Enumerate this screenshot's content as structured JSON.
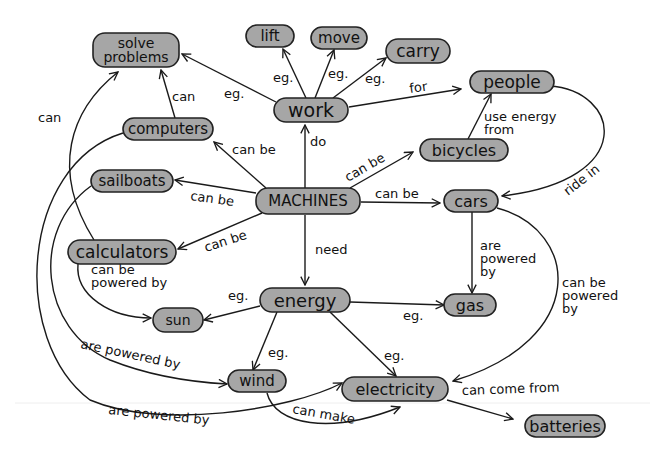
{
  "diagram": {
    "type": "concept-map",
    "colors": {
      "node_fill": "#a6a6a6",
      "node_stroke": "#222222",
      "line": "#1a1a1a",
      "background": "#ffffff"
    },
    "nodes": [
      {
        "id": "machines",
        "label": "MACHINES",
        "x": 308,
        "y": 201,
        "w": 104,
        "h": 26,
        "fs": 15
      },
      {
        "id": "work",
        "label": "work",
        "x": 311,
        "y": 110,
        "w": 74,
        "h": 24,
        "fs": 19
      },
      {
        "id": "lift",
        "label": "lift",
        "x": 270,
        "y": 36,
        "w": 48,
        "h": 22,
        "fs": 15
      },
      {
        "id": "move",
        "label": "move",
        "x": 339,
        "y": 38,
        "w": 56,
        "h": 22,
        "fs": 15
      },
      {
        "id": "carry",
        "label": "carry",
        "x": 418,
        "y": 51,
        "w": 64,
        "h": 24,
        "fs": 17
      },
      {
        "id": "solve_problems",
        "label": "solve|problems",
        "x": 136,
        "y": 50,
        "w": 86,
        "h": 34,
        "fs": 14
      },
      {
        "id": "people",
        "label": "people",
        "x": 512,
        "y": 82,
        "w": 84,
        "h": 22,
        "fs": 17
      },
      {
        "id": "computers",
        "label": "computers",
        "x": 168,
        "y": 129,
        "w": 90,
        "h": 22,
        "fs": 15
      },
      {
        "id": "bicycles",
        "label": "bicycles",
        "x": 464,
        "y": 150,
        "w": 88,
        "h": 22,
        "fs": 16
      },
      {
        "id": "sailboats",
        "label": "sailboats",
        "x": 132,
        "y": 181,
        "w": 82,
        "h": 22,
        "fs": 15
      },
      {
        "id": "cars",
        "label": "cars",
        "x": 471,
        "y": 201,
        "w": 54,
        "h": 22,
        "fs": 16
      },
      {
        "id": "calculators",
        "label": "calculators",
        "x": 122,
        "y": 252,
        "w": 108,
        "h": 24,
        "fs": 17
      },
      {
        "id": "energy",
        "label": "energy",
        "x": 305,
        "y": 300,
        "w": 90,
        "h": 24,
        "fs": 18
      },
      {
        "id": "sun",
        "label": "sun",
        "x": 178,
        "y": 320,
        "w": 50,
        "h": 24,
        "fs": 14
      },
      {
        "id": "gas",
        "label": "gas",
        "x": 470,
        "y": 305,
        "w": 52,
        "h": 22,
        "fs": 16
      },
      {
        "id": "wind",
        "label": "wind",
        "x": 257,
        "y": 381,
        "w": 58,
        "h": 22,
        "fs": 15
      },
      {
        "id": "electricity",
        "label": "electricity",
        "x": 395,
        "y": 389,
        "w": 106,
        "h": 24,
        "fs": 16
      },
      {
        "id": "batteries",
        "label": "batteries",
        "x": 565,
        "y": 426,
        "w": 80,
        "h": 22,
        "fs": 16
      }
    ],
    "edges": [
      {
        "from": "work",
        "to": "lift",
        "label": "eg.",
        "d": "M 306 98 L 283 49",
        "lx": 273,
        "ly": 82,
        "rot": 0
      },
      {
        "from": "work",
        "to": "move",
        "label": "eg.",
        "d": "M 315 98 L 334 50",
        "lx": 328,
        "ly": 78,
        "rot": 0
      },
      {
        "from": "work",
        "to": "carry",
        "label": "eg.",
        "d": "M 333 98 L 386 58",
        "lx": 365,
        "ly": 83,
        "rot": 0
      },
      {
        "from": "work",
        "to": "solve_problems",
        "label": "eg.",
        "d": "M 276 102 L 182 54",
        "lx": 224,
        "ly": 98,
        "rot": 0
      },
      {
        "from": "work",
        "to": "people",
        "label": "for",
        "d": "M 349 107 L 461 89",
        "lx": 410,
        "ly": 93,
        "rot": -8
      },
      {
        "from": "machines",
        "to": "work",
        "label": "do",
        "d": "M 305 188 L 305 125",
        "lx": 310,
        "ly": 146,
        "rot": 0
      },
      {
        "from": "machines",
        "to": "computers",
        "label": "can be",
        "d": "M 266 188 L 214 142",
        "lx": 232,
        "ly": 154,
        "rot": 0
      },
      {
        "from": "machines",
        "to": "sailboats",
        "label": "can be",
        "d": "M 256 193 L 175 180",
        "lx": 190,
        "ly": 200,
        "rot": 8
      },
      {
        "from": "machines",
        "to": "calculators",
        "label": "can be",
        "d": "M 262 213 L 178 249",
        "lx": 206,
        "ly": 252,
        "rot": -18
      },
      {
        "from": "machines",
        "to": "bicycles",
        "label": "can be",
        "d": "M 350 188 L 413 152",
        "lx": 348,
        "ly": 182,
        "rot": -30
      },
      {
        "from": "machines",
        "to": "cars",
        "label": "can be",
        "d": "M 361 202 L 440 203",
        "lx": 375,
        "ly": 198,
        "rot": 0
      },
      {
        "from": "machines",
        "to": "energy",
        "label": "need",
        "d": "M 305 215 L 305 285",
        "lx": 315,
        "ly": 254,
        "rot": 0
      },
      {
        "from": "computers",
        "to": "solve_problems",
        "label": "can",
        "d": "M 175 118 L 161 70",
        "lx": 172,
        "ly": 101,
        "rot": 0
      },
      {
        "from": "calculators",
        "to": "solve_problems",
        "label": "can",
        "d": "M 94 240 C 50 170, 70 110, 118 72",
        "lx": 38,
        "ly": 122,
        "rot": 0
      },
      {
        "from": "bicycles",
        "to": "people",
        "label": "use energy|from",
        "d": "M 468 139 L 491 94",
        "lx": 484,
        "ly": 121,
        "rot": 0
      },
      {
        "from": "people",
        "to": "cars",
        "label": "ride in",
        "d": "M 549 86 C 620 90, 640 180, 502 196",
        "lx": 568,
        "ly": 196,
        "rot": -38
      },
      {
        "from": "cars",
        "to": "gas",
        "label": "are|powered|by",
        "d": "M 472 212 L 472 293",
        "lx": 480,
        "ly": 250,
        "rot": 0
      },
      {
        "from": "cars",
        "to": "electricity",
        "label": "can be|powered|by",
        "d": "M 497 208 C 580 230, 590 340, 453 381",
        "lx": 562,
        "ly": 287,
        "rot": 0
      },
      {
        "from": "calculators",
        "to": "sun",
        "label": "can be|powered by",
        "d": "M 78 264 C 75 295, 110 318, 151 318",
        "lx": 91,
        "ly": 274,
        "rot": 0
      },
      {
        "from": "energy",
        "to": "sun",
        "label": "eg.",
        "d": "M 260 306 L 204 320",
        "lx": 228,
        "ly": 300,
        "rot": 0
      },
      {
        "from": "energy",
        "to": "gas",
        "label": "eg.",
        "d": "M 350 302 L 444 305",
        "lx": 403,
        "ly": 320,
        "rot": 0
      },
      {
        "from": "energy",
        "to": "wind",
        "label": "eg.",
        "d": "M 277 312 L 253 370",
        "lx": 268,
        "ly": 357,
        "rot": 0
      },
      {
        "from": "energy",
        "to": "electricity",
        "label": "eg.",
        "d": "M 330 312 L 396 376",
        "lx": 384,
        "ly": 360,
        "rot": 0
      },
      {
        "from": "sailboats",
        "to": "wind",
        "label": "are powered by",
        "d": "M 91 186 C 30 230, 40 330, 110 360 C 150 376, 190 382, 227 384",
        "lx": 80,
        "ly": 348,
        "rot": 12
      },
      {
        "from": "computers",
        "to": "electricity",
        "label": "are powered by",
        "d": "M 123 133 C 20 165, 10 340, 90 400 C 160 430, 290 410, 342 383",
        "lx": 108,
        "ly": 414,
        "rot": 6
      },
      {
        "from": "wind",
        "to": "electricity",
        "label": "can make",
        "d": "M 267 393 C 275 425, 330 435, 400 407",
        "lx": 292,
        "ly": 413,
        "rot": 10
      },
      {
        "from": "electricity",
        "to": "batteries",
        "label": "can come from",
        "d": "M 447 400 L 513 419",
        "lx": 462,
        "ly": 395,
        "rot": -2
      }
    ]
  }
}
